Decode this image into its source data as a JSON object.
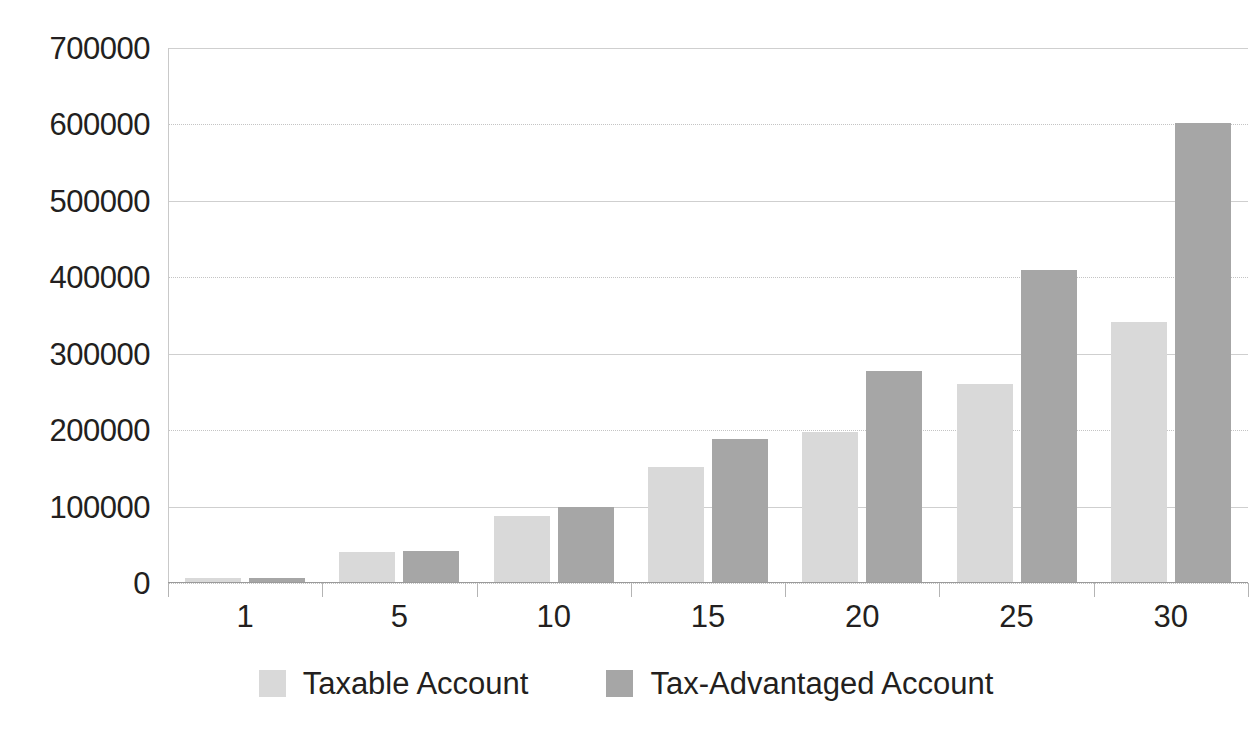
{
  "chart_data": {
    "type": "bar",
    "title": "",
    "subtitle": "",
    "xlabel": "",
    "ylabel": "",
    "categories": [
      "1",
      "5",
      "10",
      "15",
      "20",
      "25",
      "30"
    ],
    "series": [
      {
        "name": "Taxable Account",
        "color": "#d9d9d9",
        "values": [
          6000,
          40000,
          88000,
          152000,
          197000,
          260000,
          342000
        ]
      },
      {
        "name": "Tax-Advantaged Account",
        "color": "#a6a6a6",
        "values": [
          7000,
          42000,
          100000,
          188000,
          278000,
          409000,
          602000
        ]
      }
    ],
    "ylim": [
      0,
      700000
    ],
    "y_ticks": [
      0,
      100000,
      200000,
      300000,
      400000,
      500000,
      600000,
      700000
    ],
    "y_tick_labels": [
      "0",
      "100000",
      "200000",
      "300000",
      "400000",
      "500000",
      "600000",
      "700000"
    ],
    "x_tick_labels": [
      "1",
      "5",
      "10",
      "15",
      "20",
      "25",
      "30"
    ],
    "grid": true,
    "grid_axis": "y",
    "legend": [
      "Taxable Account",
      "Tax-Advantaged Account"
    ],
    "legend_position": "bottom-center"
  },
  "legend": {
    "items": [
      {
        "label": "Taxable Account",
        "swatch": "light-gray-swatch"
      },
      {
        "label": "Tax-Advantaged Account",
        "swatch": "dark-gray-swatch"
      }
    ]
  },
  "colors": {
    "series_taxable": "#d9d9d9",
    "series_tax_advantaged": "#a6a6a6",
    "gridline": "#d2d2d2",
    "axis": "#9a9a9a",
    "text": "#231f20",
    "background": "#ffffff"
  }
}
